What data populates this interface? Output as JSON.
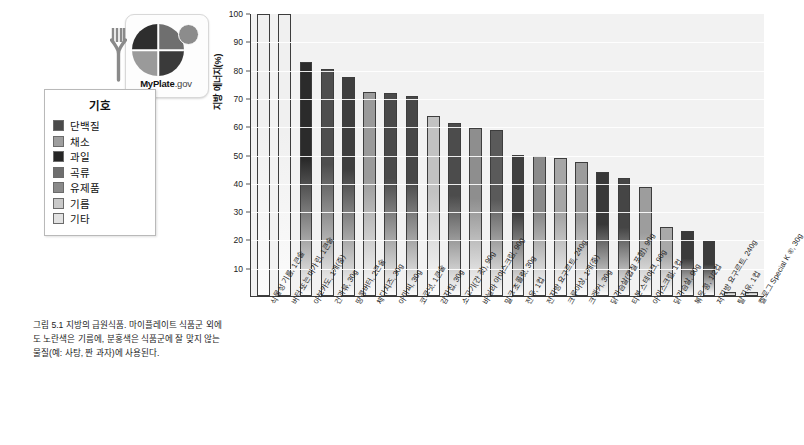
{
  "logo": {
    "name": "MyPlate.gov",
    "brand_bold": "MyPlate",
    "brand_suffix": ".gov",
    "fork_icon": "fork-icon",
    "plate_icon": "plate-icon",
    "dairy_icon": "dairy-circle-icon"
  },
  "legend": {
    "title": "기호",
    "items": [
      {
        "label": "단백질",
        "color": "#4a4a4a"
      },
      {
        "label": "채소",
        "color": "#9e9e9e"
      },
      {
        "label": "곡류",
        "color": "#6e6e6e"
      },
      {
        "label": "과일",
        "color": "#262626"
      },
      {
        "label": "유제품",
        "color": "#8a8a8a"
      },
      {
        "label": "기름",
        "color": "#c9c9c9"
      },
      {
        "label": "기타",
        "color": "#e2e2e2"
      }
    ],
    "order": [
      "단백질",
      "채소",
      "과일",
      "곡류",
      "유제품",
      "기름",
      "기타"
    ]
  },
  "caption": "그림 5.1 지방의 급원식품. 마이플레이트 식품군 외에도 노란색은 기름에, 분홍색은 식품군에 잘 맞지 않는 물질(예: 사탕, 짠 과자)에 사용된다.",
  "chart_data": {
    "type": "bar",
    "title": "",
    "xlabel": "",
    "ylabel": "지방 에너지(%)",
    "ylim": [
      0,
      100
    ],
    "yticks": [
      100,
      90,
      80,
      70,
      60,
      50,
      40,
      30,
      20,
      10
    ],
    "grid": true,
    "legend_position": "left-outside",
    "categories": [
      "식물성 기름, 1큰술",
      "버터 또는 마가린, 1큰술",
      "아보카도, 1개(중)",
      "건과류, 30g",
      "땅콩버터, 2큰술",
      "체다치즈, 30g",
      "아마씨, 30g",
      "코코넛, 1큰술",
      "감자칩, 30g",
      "소고기(간 것), 90g",
      "바닐라 아이스크림, 90g",
      "밀크 초콜릿, 30g",
      "전유, 1컵",
      "전지방 요구르트, 240g",
      "크루아상, 1개(중)",
      "크래커, 30g",
      "닭가슴살(껍질 포함), 90g",
      "티본 스테이크, 90g",
      "아이스크림, 1컵",
      "닭가슴살, 90g",
      "볶은 콩, 1/2컵",
      "저지방 요구르트, 240g",
      "탈지유, 1컵",
      "켈로그 Special K ®, 30g"
    ],
    "values": [
      100,
      100,
      83,
      80.5,
      77.5,
      72.5,
      72,
      71,
      64,
      61.5,
      59.5,
      59,
      50,
      49.5,
      49,
      47.5,
      44,
      42,
      38.5,
      24.5,
      23,
      19.5,
      1.5,
      1.5
    ],
    "groups": [
      "기름",
      "기름",
      "과일",
      "단백질",
      "단백질",
      "유제품",
      "단백질",
      "과일",
      "기타",
      "단백질",
      "유제품",
      "기타",
      "유제품",
      "유제품",
      "곡류",
      "곡류",
      "단백질",
      "단백질",
      "유제품",
      "단백질",
      "단백질",
      "유제품",
      "유제품",
      "곡류"
    ],
    "bar_colors": [
      "#f0f0f0",
      "#f0f0f0",
      "#2b2b2b",
      "#4e4e4e",
      "#3e3e3e",
      "#9b9b9b",
      "#4a4a4a",
      "#474747",
      "#c2c2c2",
      "#4c4c4c",
      "#8e8e8e",
      "#5a5a5a",
      "#3f3f3f",
      "#8a8a8a",
      "#a6a6a6",
      "#9c9c9c",
      "#383838",
      "#454545",
      "#9d9d9d",
      "#a9a9a9",
      "#3b3b3b",
      "#3c3c3c",
      "#bdbdbd",
      "#c7c7c7"
    ]
  }
}
